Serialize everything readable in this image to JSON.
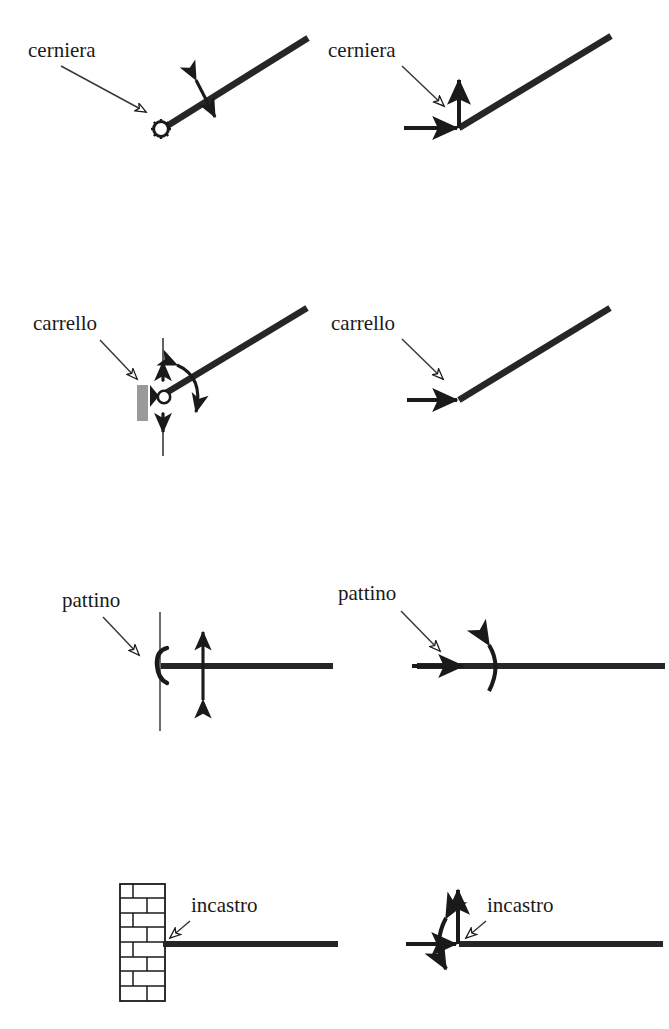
{
  "figure": {
    "kind": "engineering-diagram",
    "language": "it",
    "canvas": {
      "width": 669,
      "height": 1029
    },
    "colors": {
      "ink": "#1a1a1a",
      "beam": "#262626",
      "thin_line": "#4a4a4a",
      "wall_fill": "#9a9a9a",
      "brick_stroke": "#1a1a1a",
      "background": "#ffffff"
    }
  },
  "rows": [
    {
      "id": "cerniera",
      "left": {
        "label": "cerniera",
        "label_pos": {
          "x": 28,
          "y": 57
        },
        "support_symbol": "hinge-cog",
        "beam": "inclined",
        "freedoms": [
          "rotation"
        ],
        "arrow_kind": "straight-double-arrow-perpendicular"
      },
      "right": {
        "label": "cerniera",
        "label_pos": {
          "x": 328,
          "y": 57
        },
        "beam": "inclined",
        "reactions": [
          "vertical-force",
          "horizontal-force"
        ]
      }
    },
    {
      "id": "carrello",
      "left": {
        "label": "carrello",
        "label_pos": {
          "x": 33,
          "y": 330
        },
        "support_symbol": "roller-on-wall",
        "beam": "inclined",
        "freedoms": [
          "vertical-translation",
          "rotation"
        ],
        "arrow_kind": "vertical-double-arrow-and-rotation-arc"
      },
      "right": {
        "label": "carrello",
        "label_pos": {
          "x": 331,
          "y": 330
        },
        "beam": "inclined",
        "reactions": [
          "horizontal-force"
        ]
      }
    },
    {
      "id": "pattino",
      "left": {
        "label": "pattino",
        "label_pos": {
          "x": 62,
          "y": 607
        },
        "support_symbol": "slider-bracket",
        "beam": "horizontal",
        "freedoms": [
          "vertical-translation"
        ],
        "arrow_kind": "vertical-double-arrow"
      },
      "right": {
        "label": "pattino",
        "label_pos": {
          "x": 338,
          "y": 600
        },
        "beam": "horizontal",
        "reactions": [
          "horizontal-force",
          "moment"
        ]
      }
    },
    {
      "id": "incastro",
      "left": {
        "label": "incastro",
        "label_pos": {
          "x": 191,
          "y": 912
        },
        "support_symbol": "brick-wall-fixed",
        "beam": "horizontal",
        "freedoms": [],
        "arrow_kind": "none"
      },
      "right": {
        "label": "incastro",
        "label_pos": {
          "x": 487,
          "y": 912
        },
        "beam": "horizontal",
        "reactions": [
          "vertical-force",
          "horizontal-force",
          "moment"
        ]
      }
    }
  ],
  "legend_terms": {
    "cerniera": "cerniera",
    "carrello": "carrello",
    "pattino": "pattino",
    "incastro": "incastro"
  }
}
